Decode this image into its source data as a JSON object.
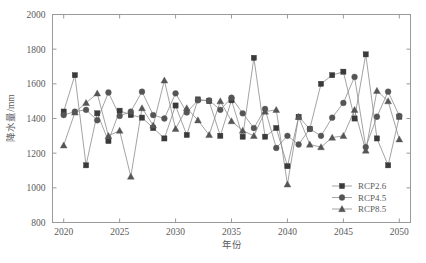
{
  "chart_data": {
    "type": "line",
    "title": "",
    "subtitle": "",
    "xlabel": "年份",
    "ylabel": "降水量/mm",
    "xlim": [
      2019,
      2051
    ],
    "ylim": [
      800,
      2000
    ],
    "xticks": [
      2020,
      2025,
      2030,
      2035,
      2040,
      2045,
      2050
    ],
    "xtick_labels": [
      "2020",
      "2025",
      "2030",
      "2035",
      "2040",
      "2045",
      "2050"
    ],
    "yticks": [
      800,
      1000,
      1200,
      1400,
      1600,
      1800,
      2000
    ],
    "ytick_labels": [
      "800",
      "1000",
      "1200",
      "1400",
      "1600",
      "1800",
      "2000"
    ],
    "grid": false,
    "legend_position": "lower right",
    "x": [
      2020,
      2021,
      2022,
      2023,
      2024,
      2025,
      2026,
      2027,
      2028,
      2029,
      2030,
      2031,
      2032,
      2033,
      2034,
      2035,
      2036,
      2037,
      2038,
      2039,
      2040,
      2041,
      2042,
      2043,
      2044,
      2045,
      2046,
      2047,
      2048,
      2049,
      2050
    ],
    "series": [
      {
        "name": "RCP2.6",
        "marker": "square",
        "color": "#3a3a3a",
        "line_color": "#8c8c8c",
        "values": [
          1440,
          1650,
          1130,
          1430,
          1270,
          1445,
          1420,
          1405,
          1345,
          1285,
          1475,
          1305,
          1510,
          1500,
          1300,
          1505,
          1295,
          1750,
          1295,
          1345,
          1125,
          1410,
          1340,
          1600,
          1650,
          1670,
          1400,
          1770,
          1285,
          1130,
          1410
        ]
      },
      {
        "name": "RCP4.5",
        "marker": "circle",
        "color": "#555555",
        "line_color": "#8c8c8c",
        "values": [
          1420,
          1440,
          1450,
          1390,
          1550,
          1415,
          1440,
          1555,
          1420,
          1400,
          1545,
          1435,
          1505,
          1505,
          1450,
          1520,
          1430,
          1345,
          1455,
          1230,
          1300,
          1250,
          1340,
          1300,
          1405,
          1490,
          1640,
          1235,
          1410,
          1555,
          1415
        ]
      },
      {
        "name": "RCP8.5",
        "marker": "triangle",
        "color": "#555555",
        "line_color": "#8c8c8c",
        "values": [
          1245,
          1435,
          1490,
          1545,
          1300,
          1330,
          1065,
          1460,
          1360,
          1620,
          1340,
          1460,
          1390,
          1305,
          1500,
          1385,
          1330,
          1300,
          1440,
          1450,
          1020,
          1410,
          1250,
          1235,
          1290,
          1300,
          1450,
          1215,
          1560,
          1500,
          1280
        ]
      }
    ]
  }
}
